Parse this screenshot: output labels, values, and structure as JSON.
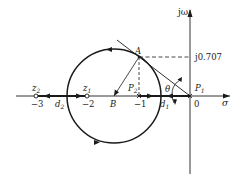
{
  "diagram": {
    "type": "root-locus",
    "axes": {
      "real_label": "σ",
      "imag_label": "jω",
      "imag_marker": "j0.707"
    },
    "tick_labels": [
      {
        "id": "m3",
        "text": "−3",
        "value": -3
      },
      {
        "id": "m2",
        "text": "−2",
        "value": -2
      },
      {
        "id": "m1",
        "text": "−1",
        "value": -1
      },
      {
        "id": "zero",
        "text": "0",
        "value": 0
      }
    ],
    "points": {
      "z2": {
        "label": "z",
        "sub": "2",
        "kind": "zero",
        "value": -3
      },
      "z1": {
        "label": "z",
        "sub": "1",
        "kind": "zero",
        "value": -2
      },
      "p2": {
        "label": "P",
        "sub": "2",
        "kind": "pole",
        "value": -1
      },
      "p1": {
        "label": "P",
        "sub": "1",
        "kind": "pole",
        "value": 0
      },
      "A": {
        "label": "A"
      },
      "B": {
        "label": "B"
      },
      "d1": {
        "label": "d",
        "sub": "1"
      },
      "d2": {
        "label": "d",
        "sub": "2"
      },
      "theta": {
        "label": "θ"
      }
    },
    "colors": {
      "stroke": "#1a1a1a",
      "axis": "#333333",
      "background": "#ffffff"
    }
  }
}
